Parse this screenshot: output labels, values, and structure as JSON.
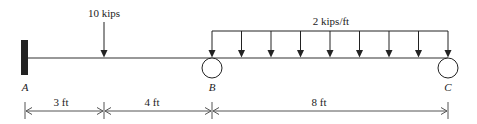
{
  "diagram": {
    "type": "beam-loading",
    "supports": [
      {
        "id": "A",
        "label": "A",
        "kind": "fixed"
      },
      {
        "id": "B",
        "label": "B",
        "kind": "roller"
      },
      {
        "id": "C",
        "label": "C",
        "kind": "roller"
      }
    ],
    "loads": {
      "point_load": {
        "label": "10 kips"
      },
      "distributed_load": {
        "label": "2 kips/ft"
      }
    },
    "dimensions": [
      {
        "label": "3 ft"
      },
      {
        "label": "4 ft"
      },
      {
        "label": "8 ft"
      }
    ],
    "colors": {
      "line": "#333333",
      "wall": "#222222",
      "dim": "#555555"
    }
  }
}
